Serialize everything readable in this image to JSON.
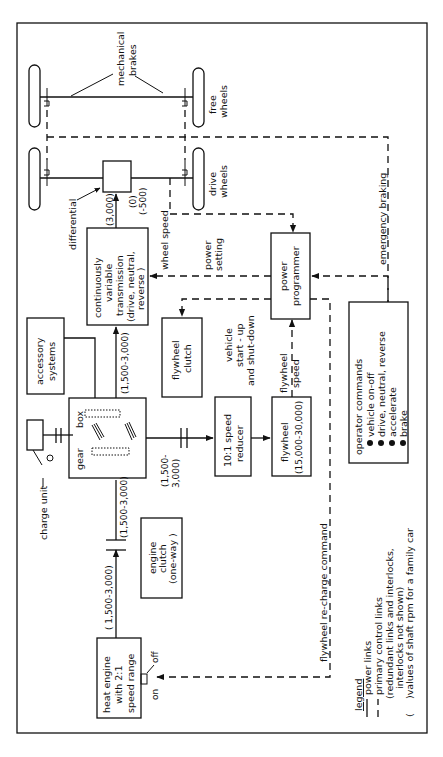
{
  "diagram": {
    "orientation": "rotated 90deg counter-clockwise",
    "wheels": {
      "free_label": [
        "free",
        "wheels"
      ],
      "drive_label": [
        "drive",
        "wheels"
      ],
      "brakes_label": [
        "mechanical",
        "brakes"
      ],
      "differential_label": "differential"
    },
    "blocks": {
      "cvt": [
        "continuously",
        "variable",
        "transmission",
        "(drive, neutral,",
        "reverse )"
      ],
      "power_programmer": [
        "power",
        "programmer"
      ],
      "operator_commands": {
        "title": "operator   commands",
        "items": [
          "vehicle  on-off",
          "drive, neutral,  reverse",
          "accelerate",
          "brake"
        ]
      },
      "accessory_systems": [
        "accessory",
        "systems"
      ],
      "gear_box": [
        "gear",
        "box"
      ],
      "flywheel_clutch": [
        "flywheel",
        "clutch"
      ],
      "speed_reducer": [
        "10:1 speed",
        "reducer"
      ],
      "flywheel": [
        "flywheel",
        "(15,000-30,000)"
      ],
      "engine_clutch": [
        "engine",
        "clutch",
        "(one-way )"
      ],
      "heat_engine": [
        "heat  engine",
        "with  2:1",
        "speed range"
      ],
      "charge_unit": "charge  unit"
    },
    "labels": {
      "cvt_out_fwd": "(3,000)",
      "cvt_out_neutral": "(0)",
      "cvt_out_rev": "(-500)",
      "cvt_in": "(1,500-3,000)",
      "gear_out_flywheel": [
        "(1,500-",
        "3,000)"
      ],
      "gear_in": "(1,500-3,000)",
      "engine_out": "( 1,500-3,000)",
      "wheel_speed": "wheel  speed",
      "power_setting": [
        "power",
        "setting"
      ],
      "vehicle_startup": [
        "vehicle",
        "start - up",
        "and  shut-down"
      ],
      "flywheel_speed": [
        "flywheel",
        "speed"
      ],
      "emergency_braking": "emergency   braking",
      "recharge_command": "flywheel   re-charge   command",
      "switch_on": "on",
      "switch_off": "off"
    },
    "legend": {
      "title": "legend",
      "items": [
        {
          "symbol": "solid",
          "text": "power  links"
        },
        {
          "symbol": "dashed",
          "text": "primary  control  links"
        },
        {
          "symbol": "",
          "text": "(redundant  links  and  interlocks,"
        },
        {
          "symbol": "",
          "text": "interlocks  not  shown)"
        },
        {
          "symbol": "(",
          "text": ")values  of  shaft  rpm  for  a family car"
        }
      ]
    }
  }
}
